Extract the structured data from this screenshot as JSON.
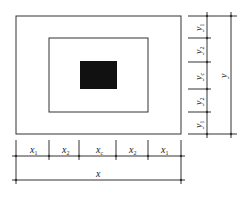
{
  "diagram": {
    "bottom_segments": [
      {
        "label": "x",
        "sub": "1"
      },
      {
        "label": "x",
        "sub": "2"
      },
      {
        "label": "x",
        "sub": "c"
      },
      {
        "label": "x",
        "sub": "2"
      },
      {
        "label": "x",
        "sub": "1"
      }
    ],
    "bottom_total": {
      "label": "x"
    },
    "right_segments": [
      {
        "label": "y",
        "sub": "1"
      },
      {
        "label": "y",
        "sub": "2"
      },
      {
        "label": "y",
        "sub": "c"
      },
      {
        "label": "y",
        "sub": "2"
      },
      {
        "label": "y",
        "sub": "1"
      }
    ],
    "right_total": {
      "label": "y"
    },
    "colors": {
      "line": "#333333",
      "core": "#111111"
    }
  }
}
